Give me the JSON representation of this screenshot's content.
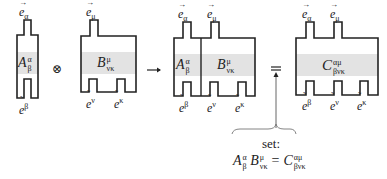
{
  "diagram": {
    "colors": {
      "outline": "#222222",
      "fill_band": "#e3e3e3",
      "background": "#ffffff"
    },
    "operators": {
      "tensor_product": "⊗",
      "arrow": "→",
      "equals": "="
    },
    "tensor_A": {
      "symbol": "A",
      "upper": "α",
      "lower": "β",
      "top_legs": [
        {
          "vector": "e",
          "index": "α"
        }
      ],
      "bottom_legs": [
        {
          "covector": "e",
          "index": "β"
        }
      ]
    },
    "tensor_B": {
      "symbol": "B",
      "upper": "μ",
      "lower": "νκ",
      "top_legs": [
        {
          "vector": "e",
          "index": "μ"
        }
      ],
      "bottom_legs": [
        {
          "covector": "e",
          "index": "ν"
        },
        {
          "covector": "e",
          "index": "κ"
        }
      ]
    },
    "tensor_AB": {
      "A_symbol": "A",
      "A_upper": "α",
      "A_lower": "β",
      "B_symbol": "B",
      "B_upper": "μ",
      "B_lower": "νκ",
      "top_legs": [
        {
          "vector": "e",
          "index": "α"
        },
        {
          "vector": "e",
          "index": "μ"
        }
      ],
      "bottom_legs": [
        {
          "covector": "e",
          "index": "β"
        },
        {
          "covector": "e",
          "index": "ν"
        },
        {
          "covector": "e",
          "index": "κ"
        }
      ]
    },
    "tensor_C": {
      "symbol": "C",
      "upper": "αμ",
      "lower": "βνκ",
      "top_legs": [
        {
          "vector": "e",
          "index": "α"
        },
        {
          "vector": "e",
          "index": "μ"
        }
      ],
      "bottom_legs": [
        {
          "covector": "e",
          "index": "β"
        },
        {
          "covector": "e",
          "index": "ν"
        },
        {
          "covector": "e",
          "index": "κ"
        }
      ]
    },
    "annotation": {
      "label": "set:",
      "formula": {
        "A": "A",
        "A_upper": "α",
        "A_lower": "β",
        "B": "B",
        "B_upper": "μ",
        "B_lower": "νκ",
        "equals": "=",
        "C": "C",
        "C_upper": "αμ",
        "C_lower": "βνκ"
      }
    }
  }
}
